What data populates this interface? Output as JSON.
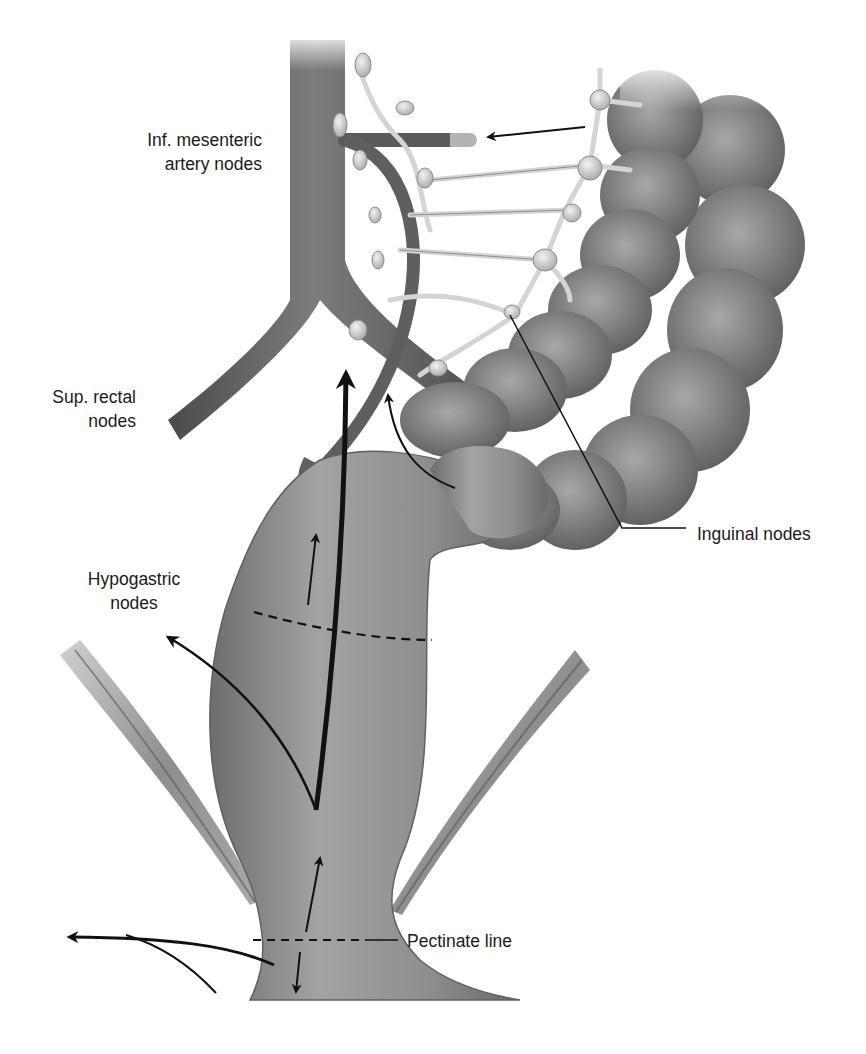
{
  "figure": {
    "colors": {
      "background": "#ffffff",
      "tissue_dark": "#5a5a5a",
      "tissue_mid": "#8a8a8a",
      "tissue_light": "#b5b5b5",
      "lymph_vessel": "#d6d6d6",
      "arrow": "#111111",
      "label_text": "#1a1a1a"
    },
    "labels": {
      "inf_mesenteric": {
        "line1": "Inf. mesenteric",
        "line2": "artery nodes"
      },
      "sup_rectal": {
        "line1": "Sup. rectal",
        "line2": "nodes"
      },
      "inguinal": {
        "line1": "Inguinal nodes"
      },
      "hypogastric": {
        "line1": "Hypogastric",
        "line2": "nodes"
      },
      "pectinate": {
        "line1": "Pectinate line"
      }
    },
    "structures": [
      "aorta",
      "common-iliac-arteries",
      "inferior-mesenteric-artery",
      "sigmoid-colon",
      "rectum",
      "anal-canal",
      "levator-ani-muscles",
      "lymph-node-chain"
    ]
  }
}
